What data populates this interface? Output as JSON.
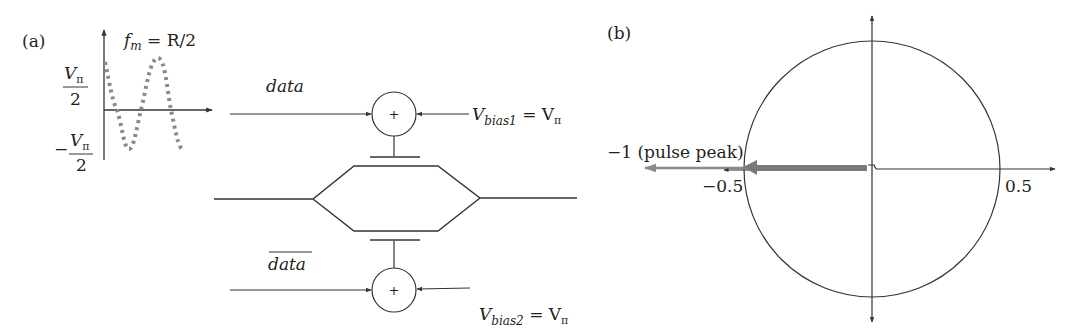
{
  "panel_a": {
    "label": "(a)",
    "drive_plot": {
      "title_f": "f",
      "title_sub": "m",
      "title_rest": " = R/2",
      "y_top_num": "V",
      "y_top_sub": "π",
      "y_top_den": "2",
      "y_bot_sign": "−",
      "y_bot_num": "V",
      "y_bot_sub": "π",
      "y_bot_den": "2",
      "waveform_style": "dotted-sinusoid",
      "waveform_color": "#8a8a8a"
    },
    "modulator": {
      "top_input": "data",
      "bottom_input": "data",
      "bottom_input_overbar": true,
      "adder_symbol": "+",
      "bias1_V": "V",
      "bias1_sub": "bias1",
      "bias1_eq": " = V",
      "bias1_pi": "π",
      "bias2_V": "V",
      "bias2_sub": "bias2",
      "bias2_eq": " = V",
      "bias2_pi": "π"
    }
  },
  "panel_b": {
    "label": "(b)",
    "pulse_label": "−1 (pulse peak)",
    "tick_neg": "−0.5",
    "tick_pos": "0.5",
    "phasor_color": "#7a7a7a"
  }
}
